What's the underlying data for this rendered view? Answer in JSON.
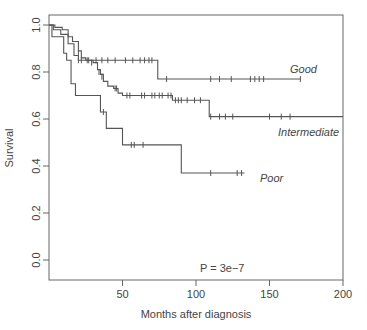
{
  "chart_data": {
    "type": "line",
    "subtype": "kaplan-meier",
    "title": "",
    "xlabel": "Months after diagnosis",
    "ylabel": "Survival",
    "xlim": [
      0,
      200
    ],
    "ylim": [
      0,
      1
    ],
    "x_ticks": [
      50,
      100,
      150,
      200
    ],
    "y_ticks": [
      "0.0",
      "0.2",
      "0.4",
      "0.6",
      "0.8",
      "1.0"
    ],
    "grid": false,
    "annotation": "P = 3e−7",
    "series": [
      {
        "name": "Good",
        "steps": [
          [
            0,
            1.0
          ],
          [
            3,
            0.98
          ],
          [
            8,
            0.96
          ],
          [
            13,
            0.92
          ],
          [
            17,
            0.87
          ],
          [
            20,
            0.85
          ],
          [
            74,
            0.85
          ],
          [
            74,
            0.77
          ],
          [
            171,
            0.77
          ]
        ],
        "censors": [
          [
            20,
            0.85
          ],
          [
            22,
            0.85
          ],
          [
            26,
            0.85
          ],
          [
            32,
            0.85
          ],
          [
            36,
            0.85
          ],
          [
            40,
            0.85
          ],
          [
            45,
            0.85
          ],
          [
            52,
            0.85
          ],
          [
            57,
            0.85
          ],
          [
            62,
            0.85
          ],
          [
            65,
            0.85
          ],
          [
            68,
            0.85
          ],
          [
            70,
            0.85
          ],
          [
            80,
            0.77
          ],
          [
            110,
            0.77
          ],
          [
            116,
            0.77
          ],
          [
            124,
            0.77
          ],
          [
            137,
            0.77
          ],
          [
            140,
            0.77
          ],
          [
            143,
            0.77
          ],
          [
            146,
            0.77
          ],
          [
            171,
            0.77
          ]
        ]
      },
      {
        "name": "Intermediate",
        "steps": [
          [
            0,
            1.0
          ],
          [
            4,
            0.99
          ],
          [
            9,
            0.98
          ],
          [
            13,
            0.95
          ],
          [
            16,
            0.93
          ],
          [
            20,
            0.89
          ],
          [
            22,
            0.86
          ],
          [
            25,
            0.85
          ],
          [
            30,
            0.84
          ],
          [
            33,
            0.81
          ],
          [
            35,
            0.79
          ],
          [
            37,
            0.76
          ],
          [
            40,
            0.74
          ],
          [
            44,
            0.73
          ],
          [
            47,
            0.71
          ],
          [
            50,
            0.7
          ],
          [
            84,
            0.7
          ],
          [
            84,
            0.68
          ],
          [
            109,
            0.68
          ],
          [
            109,
            0.61
          ],
          [
            200,
            0.61
          ]
        ],
        "censors": [
          [
            20,
            0.88
          ],
          [
            27,
            0.85
          ],
          [
            29,
            0.84
          ],
          [
            34,
            0.8
          ],
          [
            36,
            0.78
          ],
          [
            45,
            0.73
          ],
          [
            46,
            0.73
          ],
          [
            53,
            0.7
          ],
          [
            55,
            0.7
          ],
          [
            63,
            0.7
          ],
          [
            65,
            0.7
          ],
          [
            70,
            0.7
          ],
          [
            72,
            0.7
          ],
          [
            75,
            0.7
          ],
          [
            77,
            0.7
          ],
          [
            81,
            0.7
          ],
          [
            83,
            0.7
          ],
          [
            86,
            0.68
          ],
          [
            88,
            0.68
          ],
          [
            90,
            0.68
          ],
          [
            94,
            0.68
          ],
          [
            99,
            0.68
          ],
          [
            103,
            0.68
          ],
          [
            110,
            0.61
          ],
          [
            116,
            0.61
          ],
          [
            120,
            0.61
          ],
          [
            125,
            0.61
          ],
          [
            150,
            0.61
          ],
          [
            158,
            0.61
          ],
          [
            164,
            0.61
          ]
        ]
      },
      {
        "name": "Poor",
        "steps": [
          [
            0,
            1.0
          ],
          [
            2,
            0.95
          ],
          [
            10,
            0.95
          ],
          [
            10,
            0.88
          ],
          [
            12,
            0.85
          ],
          [
            15,
            0.75
          ],
          [
            18,
            0.75
          ],
          [
            18,
            0.7
          ],
          [
            35,
            0.7
          ],
          [
            35,
            0.63
          ],
          [
            39,
            0.63
          ],
          [
            39,
            0.56
          ],
          [
            50,
            0.56
          ],
          [
            50,
            0.49
          ],
          [
            90,
            0.49
          ],
          [
            90,
            0.37
          ],
          [
            133,
            0.37
          ]
        ],
        "censors": [
          [
            37,
            0.63
          ],
          [
            56,
            0.49
          ],
          [
            58,
            0.49
          ],
          [
            64,
            0.49
          ],
          [
            110,
            0.37
          ],
          [
            128,
            0.37
          ],
          [
            131,
            0.37
          ]
        ]
      }
    ],
    "labels": [
      {
        "text": "Good",
        "x": 170,
        "y": 0.81
      },
      {
        "text": "Intermediate",
        "x": 162,
        "y": 0.55
      },
      {
        "text": "Poor",
        "x": 108,
        "y": 0.37
      }
    ]
  },
  "axes": {
    "xlabel": "Months after diagnosis",
    "ylabel": "Survival",
    "annotation": "P = 3e−7",
    "label_good": "Good",
    "label_intermediate": "Intermediate",
    "label_poor": "Poor"
  },
  "colors": {
    "axis": "#555555",
    "curve": "#555555",
    "text": "#444444"
  }
}
